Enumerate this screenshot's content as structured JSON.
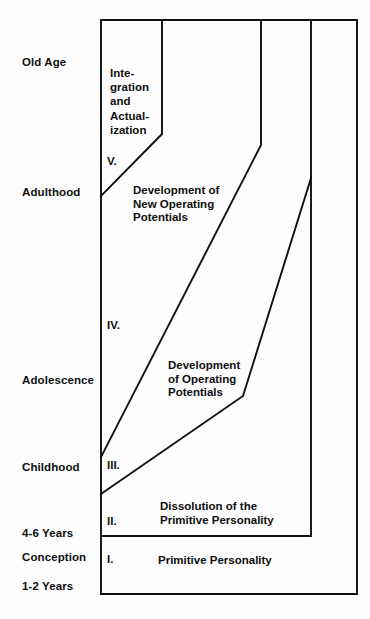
{
  "diagram": {
    "ink_color": "#101010",
    "background_color": "#fdfdfd",
    "axis_labels": [
      {
        "name": "old-age",
        "text": "Old Age"
      },
      {
        "name": "adulthood",
        "text": "Adulthood"
      },
      {
        "name": "adolescence",
        "text": "Adolescence"
      },
      {
        "name": "childhood",
        "text": "Childhood"
      },
      {
        "name": "four-six-years",
        "text": "4-6 Years"
      },
      {
        "name": "conception",
        "text": "Conception"
      },
      {
        "name": "one-two-years",
        "text": "1-2 Years"
      }
    ],
    "zones": [
      {
        "numeral": "V.",
        "label": "Inte-\ngration\nand\nActual-\nization",
        "label_plain": "Integration and Actualization"
      },
      {
        "numeral": "IV.",
        "label": "Development of\nNew Operating\nPotentials",
        "label_plain": "Development of New Operating Potentials"
      },
      {
        "numeral": "III.",
        "label": "Development\nof Operating\nPotentials",
        "label_plain": "Development of Operating Potentials"
      },
      {
        "numeral": "II.",
        "label": "Dissolution of the\nPrimitive Personality",
        "label_plain": "Dissolution of the Primitive Personality"
      },
      {
        "numeral": "I.",
        "label": "Primitive Personality",
        "label_plain": "Primitive Personality"
      }
    ]
  }
}
